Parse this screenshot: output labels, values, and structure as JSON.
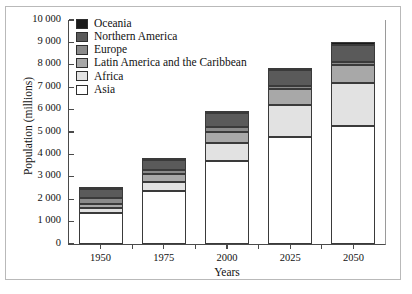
{
  "chart_data": {
    "type": "bar",
    "stacked": true,
    "title": "",
    "xlabel": "Years",
    "ylabel": "Population (millions)",
    "categories": [
      "1950",
      "1975",
      "2000",
      "2025",
      "2050"
    ],
    "ylim": [
      0,
      10000
    ],
    "ytick_step": 1000,
    "ytick_labels": [
      "0",
      "1 000",
      "2 000",
      "3 000",
      "4 000",
      "5 000",
      "6 000",
      "7 000",
      "8 000",
      "9 000",
      "10 000"
    ],
    "ytick_values": [
      0,
      1000,
      2000,
      3000,
      4000,
      5000,
      6000,
      7000,
      8000,
      9000,
      10000
    ],
    "grid": false,
    "legend_position": "top-left",
    "series": [
      {
        "name": "Asia",
        "color": "#ffffff",
        "values": [
          1400,
          2380,
          3700,
          4780,
          5250
        ]
      },
      {
        "name": "Africa",
        "color": "#e2e2e2",
        "values": [
          230,
          410,
          800,
          1420,
          1950
        ]
      },
      {
        "name": "Latin America and the Caribbean",
        "color": "#a8a8a8",
        "values": [
          170,
          320,
          520,
          700,
          780
        ]
      },
      {
        "name": "Europe",
        "color": "#8a8a8a",
        "values": [
          250,
          180,
          190,
          170,
          150
        ]
      },
      {
        "name": "Northern America",
        "color": "#5a5a5a",
        "values": [
          400,
          460,
          620,
          680,
          740
        ]
      },
      {
        "name": "Oceania",
        "color": "#1a1a1a",
        "values": [
          70,
          90,
          110,
          130,
          150
        ]
      }
    ],
    "totals": [
      2520,
      3840,
      5940,
      7880,
      9020
    ]
  },
  "legend": {
    "items": [
      {
        "label": "Oceania",
        "color": "#1a1a1a"
      },
      {
        "label": "Northern America",
        "color": "#5a5a5a"
      },
      {
        "label": "Europe",
        "color": "#8a8a8a"
      },
      {
        "label": "Latin America and the Caribbean",
        "color": "#a8a8a8"
      },
      {
        "label": "Africa",
        "color": "#e2e2e2"
      },
      {
        "label": "Asia",
        "color": "#ffffff"
      }
    ]
  }
}
